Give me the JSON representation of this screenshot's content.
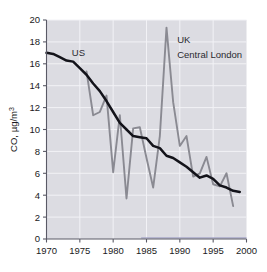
{
  "chart_data": {
    "type": "line",
    "title": "",
    "subtitle": "",
    "xlabel": "",
    "ylabel": "CO, µg/m³",
    "ylabel_parts": {
      "prefix": "CO, µg/m",
      "exponent": "3"
    },
    "xlim": [
      1970,
      2000
    ],
    "ylim": [
      0,
      20
    ],
    "grid": true,
    "legend_position": "in-plot-annotations",
    "xticks": [
      1970,
      1975,
      1980,
      1985,
      1990,
      1995,
      2000
    ],
    "xtick_labels": [
      "1970",
      "1975",
      "1980",
      "1985",
      "1990",
      "1995",
      "2000"
    ],
    "yticks": [
      0,
      2,
      4,
      6,
      8,
      10,
      12,
      14,
      16,
      18,
      20
    ],
    "ytick_labels": [
      "0",
      "2",
      "4",
      "6",
      "8",
      "10",
      "12",
      "14",
      "16",
      "18",
      "20"
    ],
    "annotations": [
      {
        "text": "US",
        "x": 1973.8,
        "y": 17.0,
        "series": "US"
      },
      {
        "text": "UK",
        "x": 1989.6,
        "y": 18.2,
        "series": "UK"
      },
      {
        "text": "Central London",
        "x": 1989.6,
        "y": 16.8,
        "series": "UK"
      }
    ],
    "colors": {
      "us_line": "#13131a",
      "uk_line": "#8a8a92",
      "plot_background": "#dcdce2",
      "gridlines": "#f2f2f6",
      "axis": "#5a5a66",
      "baseline_accent": "#a8a8c8",
      "page_background": "#ffffff"
    },
    "series": [
      {
        "name": "US",
        "label": "US",
        "color": "#13131a",
        "x": [
          1970,
          1971,
          1972,
          1973,
          1974,
          1975,
          1976,
          1977,
          1978,
          1979,
          1980,
          1981,
          1982,
          1983,
          1984,
          1985,
          1986,
          1987,
          1988,
          1989,
          1990,
          1991,
          1992,
          1993,
          1994,
          1995,
          1996,
          1997,
          1998,
          1999
        ],
        "y": [
          17.0,
          16.9,
          16.6,
          16.3,
          16.2,
          15.6,
          15.0,
          14.2,
          13.5,
          12.6,
          11.6,
          10.6,
          10.0,
          9.4,
          9.3,
          9.2,
          8.5,
          8.3,
          7.6,
          7.4,
          7.0,
          6.6,
          6.1,
          5.6,
          5.8,
          5.5,
          4.9,
          4.7,
          4.4,
          4.3
        ]
      },
      {
        "name": "UK Central London",
        "label": "UK Central London",
        "color": "#8a8a92",
        "x": [
          1976,
          1977,
          1978,
          1979,
          1980,
          1981,
          1982,
          1983,
          1984,
          1985,
          1986,
          1987,
          1988,
          1989,
          1990,
          1991,
          1992,
          1993,
          1994,
          1995,
          1996,
          1997,
          1998
        ],
        "y": [
          15.3,
          11.3,
          11.6,
          13.1,
          6.1,
          11.3,
          3.7,
          10.1,
          10.2,
          7.4,
          4.7,
          9.4,
          19.3,
          12.5,
          8.5,
          9.4,
          5.7,
          6.0,
          7.5,
          5.0,
          4.8,
          6.0,
          3.0
        ]
      }
    ]
  }
}
